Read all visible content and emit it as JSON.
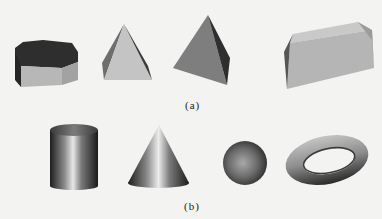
{
  "figure": {
    "row_a": {
      "label": "(a)",
      "shapes": [
        "hexagonal-prism",
        "square-pyramid",
        "tetrahedron",
        "trapezoidal-prism"
      ],
      "style": "flat-shaded polyhedra"
    },
    "row_b": {
      "label": "(b)",
      "shapes": [
        "cylinder",
        "cone",
        "sphere",
        "torus"
      ],
      "style": "smooth-shaded curved surfaces"
    }
  },
  "colors": {
    "background": "#f3f3f1",
    "dark_face": "#2e2e2e",
    "mid_face": "#8a8a8a",
    "light_face": "#b9b9b9",
    "highlight": "#e8e8e8",
    "shadow": "#1e1e1e"
  }
}
